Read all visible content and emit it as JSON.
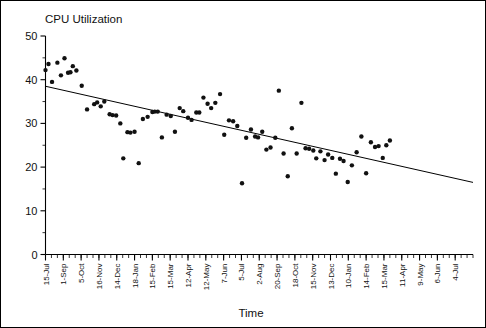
{
  "chart_data": {
    "type": "scatter",
    "title": "CPU Utilization",
    "xlabel": "Time",
    "ylabel": "",
    "ylim": [
      0,
      50
    ],
    "yticks": [
      0,
      10,
      20,
      30,
      40,
      50
    ],
    "grid": false,
    "legend": null,
    "xtick_labels": [
      "15-Jul",
      "1-Sep",
      "5-Oct",
      "16-Nov",
      "14-Dec",
      "18-Jan",
      "15-Feb",
      "15-Mar",
      "12-Apr",
      "12-May",
      "7-Jun",
      "5-Jul",
      "2-Aug",
      "20-Sep",
      "18-Oct",
      "15-Nov",
      "13-Dec",
      "10-Jan",
      "14-Feb",
      "15-Mar",
      "11-Apr",
      "9-May",
      "6-Jun",
      "4-Jul"
    ],
    "xtick_index": [
      0,
      3,
      6,
      9,
      12,
      15,
      18,
      21,
      24,
      27,
      30,
      33,
      36,
      39,
      42,
      45,
      48,
      51,
      54,
      57,
      60,
      63,
      66,
      69
    ],
    "x_minor_count": 72,
    "series": [
      {
        "name": "CPU Utilization",
        "marker": "circle",
        "color": "#111111",
        "points": [
          [
            0.0,
            42.2
          ],
          [
            0.5,
            43.6
          ],
          [
            1.1,
            39.5
          ],
          [
            2.0,
            43.9
          ],
          [
            2.6,
            41.0
          ],
          [
            3.2,
            44.9
          ],
          [
            3.8,
            41.6
          ],
          [
            4.2,
            41.7
          ],
          [
            4.6,
            43.1
          ],
          [
            5.2,
            42.1
          ],
          [
            6.1,
            38.6
          ],
          [
            7.0,
            33.2
          ],
          [
            8.2,
            34.4
          ],
          [
            8.7,
            34.8
          ],
          [
            9.3,
            33.9
          ],
          [
            9.9,
            35.0
          ],
          [
            10.8,
            32.1
          ],
          [
            11.3,
            31.9
          ],
          [
            11.9,
            31.8
          ],
          [
            12.6,
            30.0
          ],
          [
            13.1,
            22.0
          ],
          [
            13.8,
            28.0
          ],
          [
            14.3,
            27.9
          ],
          [
            15.0,
            28.1
          ],
          [
            15.7,
            20.9
          ],
          [
            16.4,
            31.0
          ],
          [
            17.2,
            31.5
          ],
          [
            18.0,
            32.6
          ],
          [
            18.4,
            32.7
          ],
          [
            18.9,
            32.7
          ],
          [
            19.6,
            26.8
          ],
          [
            20.4,
            32.0
          ],
          [
            21.1,
            31.7
          ],
          [
            21.8,
            28.1
          ],
          [
            22.6,
            33.5
          ],
          [
            23.2,
            32.8
          ],
          [
            24.0,
            31.3
          ],
          [
            24.6,
            30.8
          ],
          [
            25.4,
            32.5
          ],
          [
            25.9,
            32.5
          ],
          [
            26.6,
            35.9
          ],
          [
            27.3,
            34.5
          ],
          [
            27.9,
            33.5
          ],
          [
            28.6,
            34.7
          ],
          [
            29.4,
            36.7
          ],
          [
            30.1,
            27.4
          ],
          [
            30.9,
            30.7
          ],
          [
            31.6,
            30.5
          ],
          [
            32.3,
            29.4
          ],
          [
            33.1,
            16.3
          ],
          [
            33.8,
            26.7
          ],
          [
            34.6,
            28.6
          ],
          [
            35.3,
            27.0
          ],
          [
            35.8,
            26.8
          ],
          [
            36.5,
            28.1
          ],
          [
            37.2,
            24.0
          ],
          [
            37.9,
            24.5
          ],
          [
            38.7,
            26.7
          ],
          [
            39.3,
            37.5
          ],
          [
            40.1,
            23.1
          ],
          [
            40.8,
            17.9
          ],
          [
            41.5,
            28.9
          ],
          [
            42.3,
            23.1
          ],
          [
            43.1,
            34.7
          ],
          [
            43.8,
            24.3
          ],
          [
            44.4,
            24.2
          ],
          [
            45.1,
            23.8
          ],
          [
            45.6,
            22.0
          ],
          [
            46.3,
            23.6
          ],
          [
            47.0,
            21.6
          ],
          [
            47.6,
            22.9
          ],
          [
            48.3,
            22.1
          ],
          [
            48.9,
            18.5
          ],
          [
            49.6,
            21.9
          ],
          [
            50.2,
            21.4
          ],
          [
            50.9,
            16.6
          ],
          [
            51.6,
            20.4
          ],
          [
            52.4,
            23.4
          ],
          [
            53.2,
            27.0
          ],
          [
            54.0,
            18.6
          ],
          [
            54.8,
            25.7
          ],
          [
            55.5,
            24.6
          ],
          [
            56.1,
            24.8
          ],
          [
            56.8,
            22.1
          ],
          [
            57.4,
            25.0
          ],
          [
            58.0,
            26.1
          ]
        ]
      }
    ],
    "trend_line": {
      "name": "linear-fit",
      "x_start": 0,
      "x_end": 72,
      "y_start": 38.5,
      "y_end": 16.5,
      "color": "#000000"
    }
  },
  "figure": {
    "background": "#ffffff",
    "border_color": "#000000"
  }
}
